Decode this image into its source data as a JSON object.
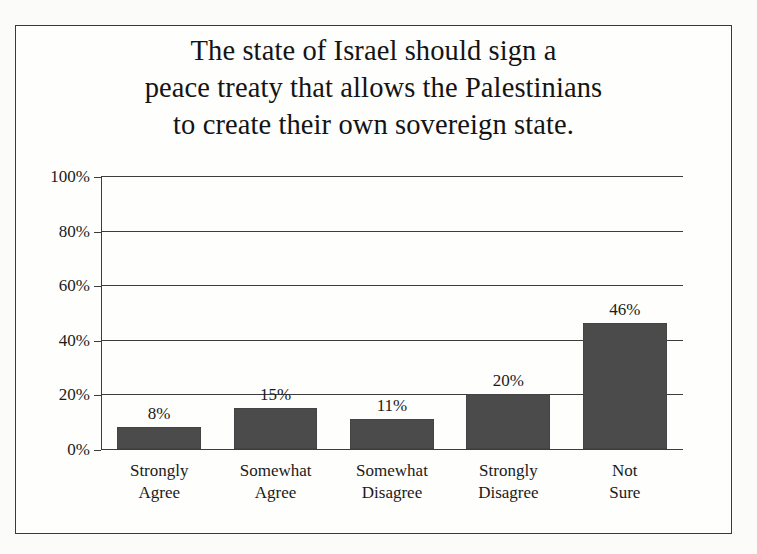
{
  "chart_data": {
    "type": "bar",
    "title": "The state of Israel should sign a peace treaty that allows the Palestinians to create their own sovereign state.",
    "title_lines": [
      "The state of Israel should sign a",
      "peace treaty that allows the Palestinians",
      "to create their own sovereign state."
    ],
    "categories": [
      "Strongly Agree",
      "Somewhat Agree",
      "Somewhat Disagree",
      "Strongly Disagree",
      "Not Sure"
    ],
    "category_lines": [
      [
        "Strongly",
        "Agree"
      ],
      [
        "Somewhat",
        "Agree"
      ],
      [
        "Somewhat",
        "Disagree"
      ],
      [
        "Strongly",
        "Disagree"
      ],
      [
        "Not",
        "Sure"
      ]
    ],
    "values": [
      8,
      15,
      11,
      20,
      46
    ],
    "value_labels": [
      "8%",
      "15%",
      "11%",
      "20%",
      "46%"
    ],
    "xlabel": "",
    "ylabel": "",
    "ylim": [
      0,
      100
    ],
    "ytick_values": [
      0,
      20,
      40,
      60,
      80,
      100
    ],
    "ytick_labels": [
      "0%",
      "20%",
      "40%",
      "60%",
      "80%",
      "100%"
    ],
    "grid": true,
    "legend": false,
    "bar_color": "#4b4b4b",
    "axis_color": "#3c3c3c",
    "background_color": "#fefefd",
    "border_color": "#3a3a3a"
  }
}
